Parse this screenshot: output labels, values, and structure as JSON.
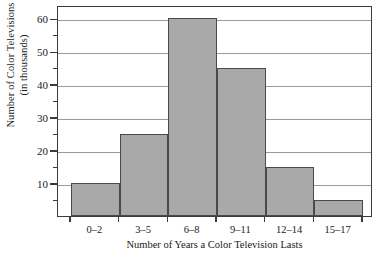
{
  "chart_data": {
    "type": "bar",
    "title": "",
    "subtitle": "",
    "xlabel": "Number of Years a Color Television Lasts",
    "ylabel": "Number of Color Televisions (in thousands)",
    "ylabel_line1": "Number of Color Televisions",
    "ylabel_line2": "(in thousands)",
    "categories": [
      "0–2",
      "3–5",
      "6–8",
      "9–11",
      "12–14",
      "15–17"
    ],
    "values": [
      10,
      25,
      60,
      45,
      15,
      5
    ],
    "ylim": [
      0,
      64
    ],
    "xlim_note": "six adjacent class intervals, bars flush to each other",
    "y_major_ticks": [
      10,
      20,
      30,
      40,
      50,
      60
    ],
    "y_major_tick_labels": [
      "10",
      "20",
      "30",
      "40",
      "50",
      "60"
    ],
    "y_minor_ticks": [
      5,
      15,
      25,
      35,
      45,
      55
    ],
    "grid": "horizontal-major-only",
    "legend": "none",
    "bar_fill_color": "#a9a9a9",
    "bar_edge_color": "#4a4a4a",
    "gridline_color": "#9a9a9a",
    "axis_color": "#3b3b3b",
    "background_color": "#ffffff"
  }
}
